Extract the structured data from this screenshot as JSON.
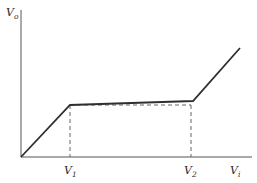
{
  "diagram": {
    "type": "transfer-characteristic",
    "axes": {
      "y_label": "V",
      "y_label_sub": "o",
      "x_label": "V",
      "x_label_sub": "i"
    },
    "ticks": [
      {
        "label": "V",
        "sub": "1"
      },
      {
        "label": "V",
        "sub": "2"
      }
    ],
    "curve": {
      "description": "Piecewise linear: steep rise from origin to V1, nearly flat plateau from V1 to V2, steep rise after V2",
      "points_px": [
        [
          21,
          157
        ],
        [
          70,
          105
        ],
        [
          193,
          101
        ],
        [
          240,
          48
        ]
      ]
    },
    "reference_lines": {
      "style": "dashed",
      "vertical_at": [
        "V1",
        "V2"
      ],
      "horizontal_level": "output at V1"
    },
    "colors": {
      "line": "#2f2f2f",
      "axis": "#555555",
      "dashed": "#666666",
      "background": "#ffffff"
    }
  }
}
